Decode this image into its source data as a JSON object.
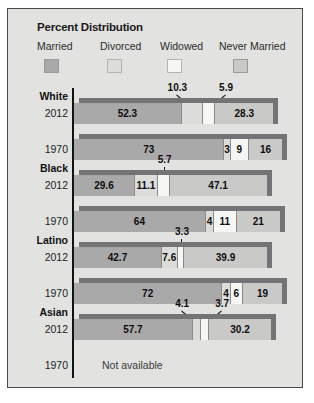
{
  "chart_data": {
    "type": "bar",
    "title": "Percent Distribution",
    "subtype": "stacked-horizontal-3d",
    "xlabel": "",
    "ylabel": "",
    "xlim": [
      0,
      100
    ],
    "grid": false,
    "legend_position": "top",
    "series": [
      {
        "name": "Married",
        "key": "married",
        "color": "#a9a9a9"
      },
      {
        "name": "Divorced",
        "key": "divorced",
        "color": "#dcdcda"
      },
      {
        "name": "Widowed",
        "key": "widowed",
        "color": "#f6f6f4"
      },
      {
        "name": "Never Married",
        "key": "never_married",
        "color": "#c9c9c7"
      }
    ],
    "groups": [
      {
        "label": "White",
        "rows": [
          {
            "year": "2012",
            "available": true,
            "values": [
              52.3,
              10.3,
              5.9,
              28.3
            ],
            "labels": [
              "52.3",
              "10.3",
              "5.9",
              "28.3"
            ],
            "callouts": [
              1,
              2
            ]
          },
          {
            "year": "1970",
            "available": true,
            "values": [
              73,
              3,
              9,
              16
            ],
            "labels": [
              "73",
              "3",
              "9",
              "16"
            ],
            "callouts": []
          }
        ]
      },
      {
        "label": "Black",
        "rows": [
          {
            "year": "2012",
            "available": true,
            "values": [
              29.6,
              11.1,
              5.7,
              47.1
            ],
            "labels": [
              "29.6",
              "11.1",
              "5.7",
              "47.1"
            ],
            "callouts": [
              2
            ]
          },
          {
            "year": "1970",
            "available": true,
            "values": [
              64,
              4,
              11,
              21
            ],
            "labels": [
              "64",
              "4",
              "11",
              "21"
            ],
            "callouts": []
          }
        ]
      },
      {
        "label": "Latino",
        "rows": [
          {
            "year": "2012",
            "available": true,
            "values": [
              42.7,
              7.6,
              3.3,
              39.9
            ],
            "labels": [
              "42.7",
              "7.6",
              "3.3",
              "39.9"
            ],
            "callouts": [
              2
            ]
          },
          {
            "year": "1970",
            "available": true,
            "values": [
              72,
              4,
              6,
              19
            ],
            "labels": [
              "72",
              "4",
              "6",
              "19"
            ],
            "callouts": []
          }
        ]
      },
      {
        "label": "Asian",
        "rows": [
          {
            "year": "2012",
            "available": true,
            "values": [
              57.7,
              4.1,
              3.7,
              30.2
            ],
            "labels": [
              "57.7",
              "4.1",
              "3.7",
              "30.2"
            ],
            "callouts": [
              1,
              2
            ]
          },
          {
            "year": "1970",
            "available": false,
            "values": [],
            "labels": [],
            "na_text": "Not available",
            "callouts": []
          }
        ]
      }
    ]
  }
}
